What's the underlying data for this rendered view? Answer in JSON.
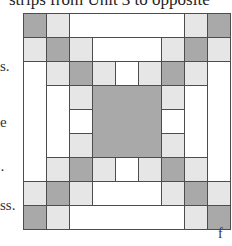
{
  "page": {
    "header_text": "strips from Unit 3 to opposite",
    "margin_fragments": [
      {
        "text": "s.",
        "y": 58
      },
      {
        "text": "e",
        "y": 114
      },
      {
        "text": "·",
        "y": 162
      },
      {
        "text": "ss.",
        "y": 197
      }
    ],
    "figure_label": "f"
  },
  "quilt_block": {
    "grid": {
      "columns": 9,
      "rows": 9,
      "origin_x": 23,
      "origin_y": 13,
      "cell_w": 23,
      "cell_h": 24
    },
    "colors": {
      "dark": "#a9a9a9",
      "light": "#e6e6e6",
      "white": "#ffffff",
      "line": "#4d4d4d"
    },
    "pieces": [
      {
        "c": 0,
        "r": 0,
        "w": 1,
        "h": 1,
        "tone": "dark"
      },
      {
        "c": 1,
        "r": 0,
        "w": 1,
        "h": 1,
        "tone": "light"
      },
      {
        "c": 2,
        "r": 0,
        "w": 5,
        "h": 1,
        "tone": "white"
      },
      {
        "c": 7,
        "r": 0,
        "w": 1,
        "h": 1,
        "tone": "light"
      },
      {
        "c": 8,
        "r": 0,
        "w": 1,
        "h": 1,
        "tone": "dark"
      },
      {
        "c": 0,
        "r": 1,
        "w": 1,
        "h": 1,
        "tone": "light"
      },
      {
        "c": 1,
        "r": 1,
        "w": 1,
        "h": 1,
        "tone": "dark"
      },
      {
        "c": 2,
        "r": 1,
        "w": 1,
        "h": 1,
        "tone": "light"
      },
      {
        "c": 3,
        "r": 1,
        "w": 3,
        "h": 1,
        "tone": "white"
      },
      {
        "c": 6,
        "r": 1,
        "w": 1,
        "h": 1,
        "tone": "light"
      },
      {
        "c": 7,
        "r": 1,
        "w": 1,
        "h": 1,
        "tone": "dark"
      },
      {
        "c": 8,
        "r": 1,
        "w": 1,
        "h": 1,
        "tone": "light"
      },
      {
        "c": 0,
        "r": 2,
        "w": 1,
        "h": 5,
        "tone": "white"
      },
      {
        "c": 1,
        "r": 2,
        "w": 1,
        "h": 1,
        "tone": "light"
      },
      {
        "c": 2,
        "r": 2,
        "w": 1,
        "h": 1,
        "tone": "dark"
      },
      {
        "c": 3,
        "r": 2,
        "w": 1,
        "h": 1,
        "tone": "light"
      },
      {
        "c": 4,
        "r": 2,
        "w": 1,
        "h": 1,
        "tone": "white"
      },
      {
        "c": 5,
        "r": 2,
        "w": 1,
        "h": 1,
        "tone": "light"
      },
      {
        "c": 6,
        "r": 2,
        "w": 1,
        "h": 1,
        "tone": "dark"
      },
      {
        "c": 7,
        "r": 2,
        "w": 1,
        "h": 1,
        "tone": "light"
      },
      {
        "c": 8,
        "r": 2,
        "w": 1,
        "h": 5,
        "tone": "white"
      },
      {
        "c": 1,
        "r": 3,
        "w": 1,
        "h": 3,
        "tone": "white"
      },
      {
        "c": 2,
        "r": 3,
        "w": 1,
        "h": 1,
        "tone": "light"
      },
      {
        "c": 3,
        "r": 3,
        "w": 3,
        "h": 3,
        "tone": "dark"
      },
      {
        "c": 6,
        "r": 3,
        "w": 1,
        "h": 1,
        "tone": "light"
      },
      {
        "c": 7,
        "r": 3,
        "w": 1,
        "h": 3,
        "tone": "white"
      },
      {
        "c": 2,
        "r": 4,
        "w": 1,
        "h": 1,
        "tone": "white"
      },
      {
        "c": 6,
        "r": 4,
        "w": 1,
        "h": 1,
        "tone": "white"
      },
      {
        "c": 2,
        "r": 5,
        "w": 1,
        "h": 1,
        "tone": "light"
      },
      {
        "c": 6,
        "r": 5,
        "w": 1,
        "h": 1,
        "tone": "light"
      },
      {
        "c": 1,
        "r": 6,
        "w": 1,
        "h": 1,
        "tone": "light"
      },
      {
        "c": 2,
        "r": 6,
        "w": 1,
        "h": 1,
        "tone": "dark"
      },
      {
        "c": 3,
        "r": 6,
        "w": 1,
        "h": 1,
        "tone": "light"
      },
      {
        "c": 4,
        "r": 6,
        "w": 1,
        "h": 1,
        "tone": "white"
      },
      {
        "c": 5,
        "r": 6,
        "w": 1,
        "h": 1,
        "tone": "light"
      },
      {
        "c": 6,
        "r": 6,
        "w": 1,
        "h": 1,
        "tone": "dark"
      },
      {
        "c": 7,
        "r": 6,
        "w": 1,
        "h": 1,
        "tone": "light"
      },
      {
        "c": 0,
        "r": 7,
        "w": 1,
        "h": 1,
        "tone": "light"
      },
      {
        "c": 1,
        "r": 7,
        "w": 1,
        "h": 1,
        "tone": "dark"
      },
      {
        "c": 2,
        "r": 7,
        "w": 1,
        "h": 1,
        "tone": "light"
      },
      {
        "c": 3,
        "r": 7,
        "w": 3,
        "h": 1,
        "tone": "white"
      },
      {
        "c": 6,
        "r": 7,
        "w": 1,
        "h": 1,
        "tone": "light"
      },
      {
        "c": 7,
        "r": 7,
        "w": 1,
        "h": 1,
        "tone": "dark"
      },
      {
        "c": 8,
        "r": 7,
        "w": 1,
        "h": 1,
        "tone": "light"
      },
      {
        "c": 0,
        "r": 8,
        "w": 1,
        "h": 1,
        "tone": "dark"
      },
      {
        "c": 1,
        "r": 8,
        "w": 1,
        "h": 1,
        "tone": "light"
      },
      {
        "c": 2,
        "r": 8,
        "w": 5,
        "h": 1,
        "tone": "white"
      },
      {
        "c": 7,
        "r": 8,
        "w": 1,
        "h": 1,
        "tone": "light"
      },
      {
        "c": 8,
        "r": 8,
        "w": 1,
        "h": 1,
        "tone": "dark"
      }
    ]
  }
}
